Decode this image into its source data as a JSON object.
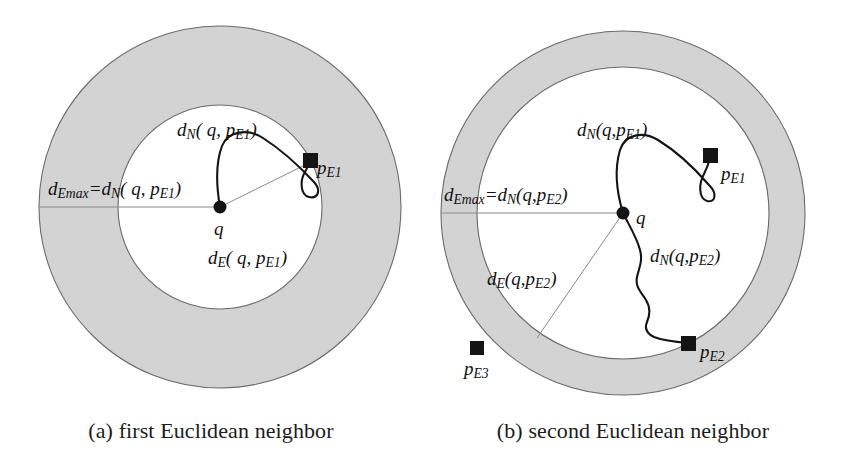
{
  "figure": {
    "background_color": "#ffffff",
    "ring_fill_color": "#d9d9d9",
    "stroke_color": "#4d4d4d",
    "curve_color": "#111111",
    "marker_color": "#1a1a1a"
  },
  "panels": [
    {
      "id": "a",
      "caption": "(a) first Euclidean neighbor",
      "geometry": {
        "center": [
          220,
          207
        ],
        "outer_radius": 181,
        "inner_radius": 102
      },
      "labels": {
        "d_emax": "d",
        "d_emax_sub": "Emax",
        "d_emax_eq": "=d",
        "d_emax_eq_sub": "N",
        "d_emax_args": "( q, p",
        "d_emax_args_sub": "E1",
        "d_emax_close": ")",
        "d_n": "d",
        "d_n_sub": "N",
        "d_n_args": "( q, p",
        "d_n_args_sub": "E1",
        "d_n_close": ")",
        "d_e": "d",
        "d_e_sub": "E",
        "d_e_args": "( q, p",
        "d_e_args_sub": "E1",
        "d_e_close": ")",
        "q": "q",
        "p_e1": "p",
        "p_e1_sub": "E1"
      },
      "points": [
        {
          "name": "q",
          "label": "q",
          "x": 220,
          "y": 207,
          "kind": "dot"
        },
        {
          "name": "p_e1",
          "label": "pE1",
          "x": 310,
          "y": 160,
          "kind": "square"
        }
      ]
    },
    {
      "id": "b",
      "caption": "(b) second Euclidean neighbor",
      "geometry": {
        "center": [
          201,
          213
        ],
        "outer_radius": 182,
        "inner_radius": 146
      },
      "labels": {
        "d_emax": "d",
        "d_emax_sub": "Emax",
        "d_emax_eq": "=d",
        "d_emax_eq_sub": "N",
        "d_emax_args": "(q,p",
        "d_emax_args_sub": "E2",
        "d_emax_close": ")",
        "d_n1": "d",
        "d_n1_sub": "N",
        "d_n1_args": "(q,p",
        "d_n1_args_sub": "E1",
        "d_n1_close": ")",
        "d_n2": "d",
        "d_n2_sub": "N",
        "d_n2_args": "(q,p",
        "d_n2_args_sub": "E2",
        "d_n2_close": ")",
        "d_e": "d",
        "d_e_sub": "E",
        "d_e_args": "(q,p",
        "d_e_args_sub": "E2",
        "d_e_close": ")",
        "q": "q",
        "p_e1": "p",
        "p_e1_sub": "E1",
        "p_e2": "p",
        "p_e2_sub": "E2",
        "p_e3": "p",
        "p_e3_sub": "E3"
      },
      "points": [
        {
          "name": "q",
          "label": "q",
          "x": 201,
          "y": 213,
          "kind": "dot"
        },
        {
          "name": "p_e1",
          "label": "pE1",
          "x": 288,
          "y": 155,
          "kind": "square"
        },
        {
          "name": "p_e2",
          "label": "pE2",
          "x": 266,
          "y": 344,
          "kind": "square"
        },
        {
          "name": "p_e3",
          "label": "pE3",
          "x": 55,
          "y": 348,
          "kind": "square"
        }
      ]
    }
  ]
}
